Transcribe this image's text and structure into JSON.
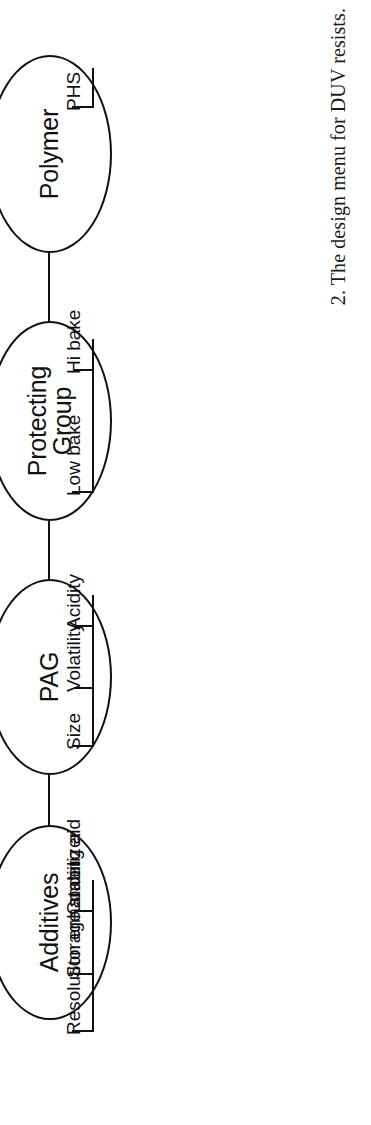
{
  "figure": {
    "caption": "2. The design menu for DUV resists.",
    "caption_number": "2.",
    "orientation": "rotated-90-ccw",
    "ink_color": "#111111",
    "background_color": "#ffffff"
  },
  "diagram": {
    "type": "tree",
    "title": "The design menu for DUV resists",
    "nodes": [
      {
        "id": "additives",
        "label": "Additives",
        "branches": [
          {
            "label": "Coating aid"
          },
          {
            "label": "Storage stabilizer"
          },
          {
            "label": "Resolution enhancer"
          }
        ]
      },
      {
        "id": "pag",
        "label": "PAG",
        "branches": [
          {
            "label": "Acidity"
          },
          {
            "label": "Volatility"
          },
          {
            "label": "Size"
          }
        ]
      },
      {
        "id": "protecting-group",
        "label": "Protecting\nGroup",
        "branches": [
          {
            "label": "Hi bake"
          },
          {
            "label": "Low bake"
          }
        ]
      },
      {
        "id": "polymer",
        "label": "Polymer",
        "branches": [
          {
            "label": "PHS"
          }
        ]
      }
    ]
  }
}
